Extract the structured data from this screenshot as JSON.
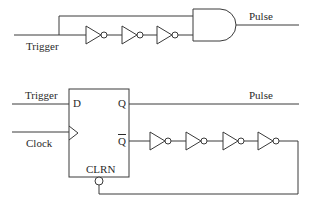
{
  "top_circuit": {
    "input_label": "Trigger",
    "output_label": "Pulse",
    "inverter_count": 3,
    "gate": "AND"
  },
  "bottom_circuit": {
    "inputs": {
      "trigger_label": "Trigger",
      "clock_label": "Clock"
    },
    "flipflop": {
      "d_label": "D",
      "q_label": "Q",
      "qbar_label": "Q",
      "clear_label": "CLRN"
    },
    "output_label": "Pulse",
    "inverter_count": 4
  },
  "colors": {
    "line": "#3a3a3a",
    "text": "#2a2a2a",
    "background": "#ffffff"
  }
}
